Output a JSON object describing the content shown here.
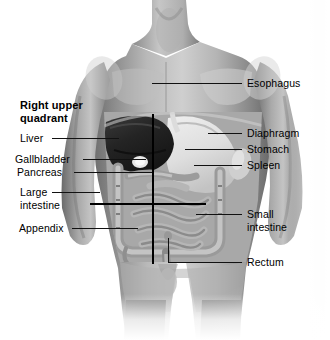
{
  "figure": {
    "style": "grayscale anatomical photograph illustration",
    "quadrant_heading": "Right upper\nquadrant",
    "background_color": "#ffffff",
    "line_color": "#111111",
    "quadrant_line_color": "#000000"
  },
  "labels_left": [
    {
      "text": "Liver",
      "organ": "liver"
    },
    {
      "text": "Gallbladder",
      "organ": "gallbladder"
    },
    {
      "text": "Pancreas",
      "organ": "pancreas"
    },
    {
      "text": "Large\nintestine",
      "organ": "large-intestine"
    },
    {
      "text": "Appendix",
      "organ": "appendix"
    }
  ],
  "labels_right": [
    {
      "text": "Esophagus",
      "organ": "esophagus"
    },
    {
      "text": "Diaphragm",
      "organ": "diaphragm"
    },
    {
      "text": "Stomach",
      "organ": "stomach"
    },
    {
      "text": "Spleen",
      "organ": "spleen"
    },
    {
      "text": "Small\nintestine",
      "organ": "small-intestine"
    },
    {
      "text": "Rectum",
      "organ": "rectum"
    }
  ]
}
